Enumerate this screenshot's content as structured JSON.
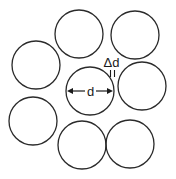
{
  "diagram": {
    "stroke_color": "#2a2a2a",
    "background": "#ffffff",
    "circles": [
      {
        "id": "top-middle",
        "cx": 79,
        "cy": 34,
        "r": 24
      },
      {
        "id": "top-right",
        "cx": 135,
        "cy": 35,
        "r": 24
      },
      {
        "id": "left-upper",
        "cx": 36,
        "cy": 65,
        "r": 24
      },
      {
        "id": "center",
        "cx": 90,
        "cy": 91,
        "r": 24
      },
      {
        "id": "right-middle",
        "cx": 142,
        "cy": 86,
        "r": 24
      },
      {
        "id": "left-lower",
        "cx": 33,
        "cy": 121,
        "r": 24
      },
      {
        "id": "bottom-middle",
        "cx": 82,
        "cy": 145,
        "r": 24
      },
      {
        "id": "bottom-right",
        "cx": 130,
        "cy": 144,
        "r": 24
      }
    ],
    "labels": {
      "diameter": "d",
      "gap": "Δd"
    }
  }
}
